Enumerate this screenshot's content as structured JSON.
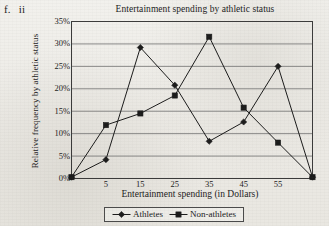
{
  "problem_label": {
    "number": "f.",
    "part": "ii"
  },
  "chart_data": {
    "type": "line",
    "title": "Entertainment spending by athletic status",
    "xlabel": "Entertainment spending (in Dollars)",
    "ylabel": "Relative frequency by athletic status",
    "grid": "horizontal",
    "legend_position": "bottom",
    "xlim": [
      -5,
      65
    ],
    "ylim": [
      0,
      35
    ],
    "x": [
      -5,
      5,
      15,
      25,
      35,
      45,
      55,
      65
    ],
    "xtick_labels": [
      "",
      "5",
      "15",
      "25",
      "35",
      "45",
      "55",
      ""
    ],
    "ytick_labels": [
      "0%",
      "5%",
      "10%",
      "15%",
      "20%",
      "25%",
      "30%",
      "35%"
    ],
    "ytick_values": [
      0,
      5,
      10,
      15,
      20,
      25,
      30,
      35
    ],
    "series": [
      {
        "name": "Athletes",
        "marker": "diamond",
        "color": "#1b1b1b",
        "values": [
          0.3,
          4.2,
          29.2,
          20.8,
          8.3,
          12.6,
          25.0,
          0.3
        ]
      },
      {
        "name": "Non-athletes",
        "marker": "square",
        "color": "#1b1b1b",
        "values": [
          0.3,
          11.9,
          14.5,
          18.5,
          31.6,
          15.8,
          8.0,
          0.3
        ]
      }
    ]
  },
  "legend": {
    "items": [
      {
        "label": "Athletes",
        "marker": "diamond"
      },
      {
        "label": "Non-athletes",
        "marker": "square"
      }
    ]
  },
  "colors": {
    "ink": "#1b1b1b",
    "grid": "#6f6f6f",
    "axis": "#3a3a3a",
    "paper": "#efeeea"
  }
}
